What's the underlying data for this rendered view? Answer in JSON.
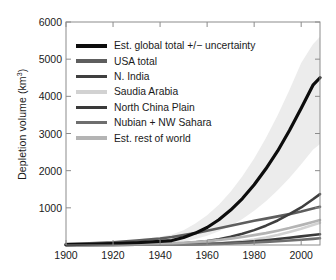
{
  "chart_data": {
    "type": "line",
    "title": "",
    "xlabel": "",
    "ylabel": "Depletion volume (km³)",
    "ylabel_text": "Depletion volume (km",
    "ylabel_sup": "3",
    "ylabel_tail": ")",
    "xlim": [
      1900,
      2008
    ],
    "ylim": [
      0,
      6000
    ],
    "grid": false,
    "legend_position": "upper-left-inside",
    "xticks": [
      1900,
      1920,
      1940,
      1960,
      1980,
      2000
    ],
    "yticks": [
      1000,
      2000,
      3000,
      4000,
      5000,
      6000
    ],
    "x": [
      1900,
      1910,
      1920,
      1930,
      1940,
      1945,
      1950,
      1955,
      1960,
      1965,
      1970,
      1975,
      1980,
      1985,
      1990,
      1995,
      2000,
      2005,
      2008
    ],
    "series": [
      {
        "name": "Est. global total +/− uncertainty",
        "color": "#0d0d0d",
        "width": 3.2,
        "values": [
          10,
          20,
          35,
          60,
          95,
          120,
          200,
          320,
          470,
          680,
          940,
          1250,
          1620,
          2050,
          2530,
          3080,
          3680,
          4300,
          4500
        ],
        "band_upper": [
          40,
          60,
          95,
          150,
          220,
          280,
          400,
          580,
          800,
          1080,
          1430,
          1850,
          2330,
          2880,
          3490,
          4170,
          4900,
          5400,
          5600
        ],
        "band_lower": [
          0,
          5,
          10,
          20,
          35,
          50,
          90,
          160,
          250,
          370,
          520,
          700,
          920,
          1180,
          1470,
          1800,
          2170,
          2560,
          2720
        ]
      },
      {
        "name": "USA total",
        "color": "#5e5e5e",
        "width": 2.6,
        "values": [
          25,
          45,
          75,
          120,
          175,
          215,
          265,
          320,
          385,
          450,
          520,
          585,
          650,
          710,
          770,
          830,
          900,
          980,
          1030
        ]
      },
      {
        "name": "N. India",
        "color": "#3f3f3f",
        "width": 2.6,
        "values": [
          2,
          4,
          8,
          14,
          22,
          30,
          45,
          70,
          105,
          155,
          220,
          300,
          400,
          520,
          660,
          830,
          1010,
          1230,
          1370
        ]
      },
      {
        "name": "Saudia Arabia",
        "color": "#d2d2d2",
        "width": 2.6,
        "values": [
          1,
          2,
          3,
          5,
          8,
          11,
          16,
          24,
          36,
          52,
          74,
          104,
          145,
          200,
          270,
          350,
          440,
          540,
          600
        ]
      },
      {
        "name": "North China Plain",
        "color": "#3a3a3a",
        "width": 2.6,
        "values": [
          1,
          2,
          3,
          5,
          8,
          10,
          14,
          20,
          28,
          40,
          56,
          76,
          100,
          128,
          160,
          196,
          232,
          268,
          290
        ]
      },
      {
        "name": "Nubian + NW Sahara",
        "color": "#6e6e6e",
        "width": 2.6,
        "values": [
          1,
          2,
          3,
          5,
          7,
          9,
          12,
          17,
          23,
          31,
          41,
          53,
          67,
          83,
          101,
          121,
          143,
          166,
          180
        ]
      },
      {
        "name": "Est. rest of world",
        "color": "#b4b4b4",
        "width": 2.6,
        "values": [
          5,
          9,
          15,
          24,
          36,
          45,
          60,
          80,
          105,
          135,
          172,
          215,
          265,
          320,
          385,
          455,
          535,
          620,
          670
        ]
      }
    ],
    "band_color": "#ececec",
    "axis_color": "#8c8c8c",
    "tick_color": "#8c8c8c",
    "background": "#ffffff"
  }
}
